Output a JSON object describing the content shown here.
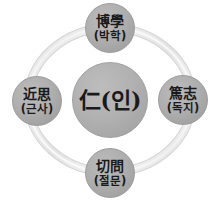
{
  "diagram": {
    "title": "",
    "background_color": "#ffffff",
    "node_fill_color": "#ababab",
    "node_border_color": "#9d9d9d",
    "ring_color": "#e8e8e8",
    "ring_shadow_color": "#d0d0d0",
    "text_color": "#1a1a1a",
    "center": {
      "id": "center",
      "label": "仁(인)",
      "hanja": "仁",
      "hangul": "(인)"
    },
    "nodes": [
      {
        "id": "top",
        "position": "top",
        "hanja": "博學",
        "hangul": "(박학)"
      },
      {
        "id": "right",
        "position": "right",
        "hanja": "篤志",
        "hangul": "(독지)"
      },
      {
        "id": "bottom",
        "position": "bottom",
        "hanja": "切問",
        "hangul": "(절문)"
      },
      {
        "id": "left",
        "position": "left",
        "hanja": "近思",
        "hangul": "(근사)"
      }
    ],
    "ring": {
      "shape": "circle",
      "center_x": 110,
      "center_y": 100,
      "radius_x": 82,
      "radius_y": 72,
      "stroke_width": 7
    }
  }
}
